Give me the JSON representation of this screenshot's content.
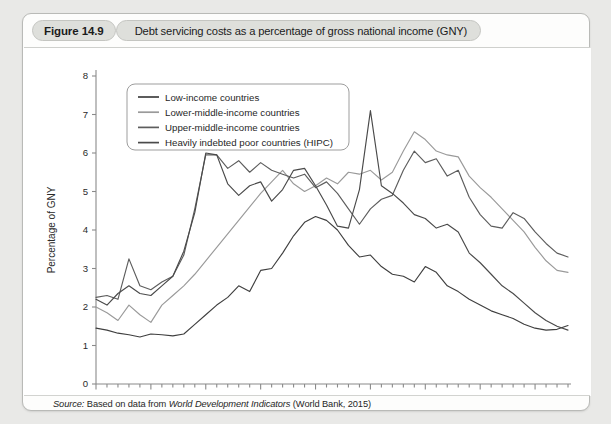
{
  "figure": {
    "number_label": "Figure 14.9",
    "title": "Debt servicing costs as a percentage of gross national income (GNY)"
  },
  "source": {
    "prefix": "Source:",
    "text_before": " Based on data from ",
    "publication": "World Development Indicators",
    "text_after": " (World Bank, 2015)"
  },
  "chart_data": {
    "type": "line",
    "title": "Debt servicing costs as a percentage of gross national income (GNY)",
    "xlabel": "",
    "ylabel": "Percentage of GNY",
    "xlim": [
      1970,
      2013
    ],
    "ylim": [
      0,
      8
    ],
    "yticks": [
      0,
      1,
      2,
      3,
      4,
      5,
      6,
      7,
      8
    ],
    "ytick_labels": [
      "0",
      "1",
      "2",
      "3",
      "4",
      "5",
      "6",
      "7",
      "8"
    ],
    "xticks": [
      1970,
      1975,
      1980,
      1985,
      1990,
      1995,
      2000,
      2005,
      2010
    ],
    "xtick_labels": [
      "1970",
      "1975",
      "1980",
      "1985",
      "1990",
      "1995",
      "2000",
      "2005",
      "2010"
    ],
    "xtick_minor_step": 1,
    "grid": false,
    "legend_position": "upper-left",
    "x": [
      1970,
      1971,
      1972,
      1973,
      1974,
      1975,
      1976,
      1977,
      1978,
      1979,
      1980,
      1981,
      1982,
      1983,
      1984,
      1985,
      1986,
      1987,
      1988,
      1989,
      1990,
      1991,
      1992,
      1993,
      1994,
      1995,
      1996,
      1997,
      1998,
      1999,
      2000,
      2001,
      2002,
      2003,
      2004,
      2005,
      2006,
      2007,
      2008,
      2009,
      2010,
      2011,
      2012,
      2013
    ],
    "series": [
      {
        "name": "Low-income countries",
        "color": "#3f3f3f",
        "values": [
          1.45,
          1.4,
          1.32,
          1.28,
          1.22,
          1.3,
          1.28,
          1.25,
          1.3,
          1.55,
          1.8,
          2.05,
          2.25,
          2.55,
          2.4,
          2.95,
          3.0,
          3.4,
          3.85,
          4.2,
          4.35,
          4.25,
          4.0,
          3.6,
          3.3,
          3.35,
          3.05,
          2.85,
          2.8,
          2.65,
          3.05,
          2.9,
          2.55,
          2.4,
          2.2,
          2.05,
          1.9,
          1.8,
          1.7,
          1.55,
          1.45,
          1.4,
          1.42,
          1.52
        ]
      },
      {
        "name": "Lower-middle-income countries",
        "color": "#9a9a9a",
        "values": [
          2.0,
          1.85,
          1.65,
          2.05,
          1.8,
          1.6,
          2.05,
          2.3,
          2.55,
          2.85,
          3.2,
          3.55,
          3.9,
          4.25,
          4.6,
          4.95,
          5.25,
          5.55,
          5.2,
          5.0,
          5.15,
          5.35,
          5.2,
          5.5,
          5.45,
          5.55,
          5.3,
          5.5,
          6.05,
          6.55,
          6.35,
          6.05,
          5.95,
          5.9,
          5.4,
          5.1,
          4.85,
          4.55,
          4.25,
          3.95,
          3.55,
          3.2,
          2.95,
          2.9
        ]
      },
      {
        "name": "Upper-middle-income countries",
        "color": "#5d5d5d",
        "values": [
          2.25,
          2.3,
          2.2,
          3.25,
          2.55,
          2.45,
          2.65,
          2.8,
          3.35,
          4.55,
          5.95,
          5.95,
          5.6,
          5.8,
          5.5,
          5.75,
          5.55,
          5.45,
          5.35,
          5.45,
          5.1,
          5.25,
          4.95,
          4.55,
          4.15,
          4.55,
          4.8,
          4.9,
          5.55,
          6.05,
          5.75,
          5.85,
          5.4,
          5.55,
          4.85,
          4.4,
          4.1,
          4.05,
          4.45,
          4.3,
          3.95,
          3.65,
          3.4,
          3.3
        ]
      },
      {
        "name": "Heavily indebted poor countries (HIPC)",
        "color": "#4a4a4a",
        "values": [
          2.2,
          2.05,
          2.35,
          2.55,
          2.35,
          2.3,
          2.55,
          2.8,
          3.45,
          4.45,
          6.0,
          5.95,
          5.2,
          4.9,
          5.15,
          5.25,
          4.75,
          5.05,
          5.55,
          5.6,
          5.15,
          4.65,
          4.1,
          4.05,
          5.05,
          7.1,
          5.15,
          4.95,
          4.7,
          4.4,
          4.3,
          4.05,
          4.15,
          3.95,
          3.4,
          3.15,
          2.85,
          2.55,
          2.35,
          2.1,
          1.85,
          1.65,
          1.5,
          1.4
        ]
      }
    ]
  },
  "legend": {
    "items": [
      {
        "label": "Low-income countries"
      },
      {
        "label": "Lower-middle-income countries"
      },
      {
        "label": "Upper-middle-income countries"
      },
      {
        "label": "Heavily indebted poor countries (HIPC)"
      }
    ]
  }
}
